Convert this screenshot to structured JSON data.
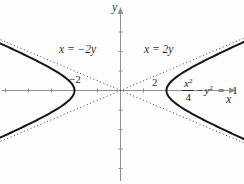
{
  "figure": {
    "y_axis_label": "y",
    "x_axis_label": "x",
    "asymptote_left_label": "x = −2y",
    "asymptote_right_label": "x = 2y",
    "vertex_left_label": "−2",
    "vertex_right_label": "2",
    "equation": {
      "numerator_var": "x",
      "numerator_sup": "2",
      "denominator": "4",
      "minus": "−",
      "y_var": "y",
      "y_sup": "2",
      "equals": "=",
      "rhs": "1"
    }
  },
  "colors": {
    "axis": "#8f8f8f",
    "curve": "#151515",
    "asymptote": "#3d3d3d",
    "text": "#2e2e2e",
    "background": "#fdfdfd"
  },
  "chart_data": {
    "type": "line",
    "equation": "x²/4 − y² = 1",
    "asymptotes": [
      "x = −2y",
      "x = 2y"
    ],
    "asymptote_slopes_math": [
      0.5,
      -0.5
    ],
    "vertices": [
      [
        -2,
        0
      ],
      [
        2,
        0
      ]
    ],
    "labeled_points_x": [
      -2,
      2
    ],
    "hyperbola": {
      "a": 2,
      "b": 1,
      "y_range": [
        -2.62,
        2.62
      ]
    },
    "xlim": [
      -5.2,
      5.4
    ],
    "ylim": [
      -4.8,
      4.3
    ],
    "x_ticks": [
      -5,
      -4,
      -3,
      -2,
      -1,
      1
    ],
    "y_ticks": [
      -4,
      -3,
      -2,
      -1,
      1,
      2,
      3
    ],
    "grid": false,
    "legend": "none",
    "geometry": {
      "origin_px": [
        120.5,
        90.5
      ],
      "px_per_unit": [
        23,
        19.5
      ],
      "x_axis_px": [
        2,
        232
      ],
      "y_axis_px": [
        10,
        181
      ]
    }
  }
}
